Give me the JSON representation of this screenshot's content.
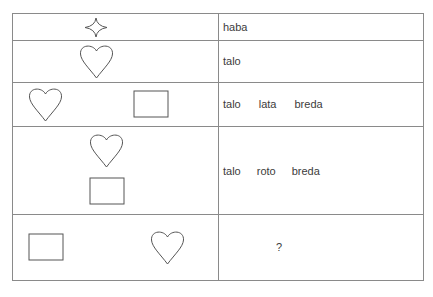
{
  "rows": [
    {
      "shapes": [
        "four-point-star"
      ],
      "words": [
        "haba"
      ]
    },
    {
      "shapes": [
        "heart"
      ],
      "words": [
        "talo"
      ]
    },
    {
      "shapes": [
        "heart",
        "rectangle"
      ],
      "words": [
        "talo",
        "lata",
        "breda"
      ]
    },
    {
      "shapes": [
        "heart",
        "rectangle"
      ],
      "words": [
        "talo",
        "roto",
        "breda"
      ]
    },
    {
      "shapes": [
        "rectangle",
        "heart"
      ],
      "words": [
        "?"
      ]
    }
  ],
  "colors": {
    "line": "#8a8a8a",
    "stroke": "#555555",
    "text": "#3c3c3c"
  }
}
